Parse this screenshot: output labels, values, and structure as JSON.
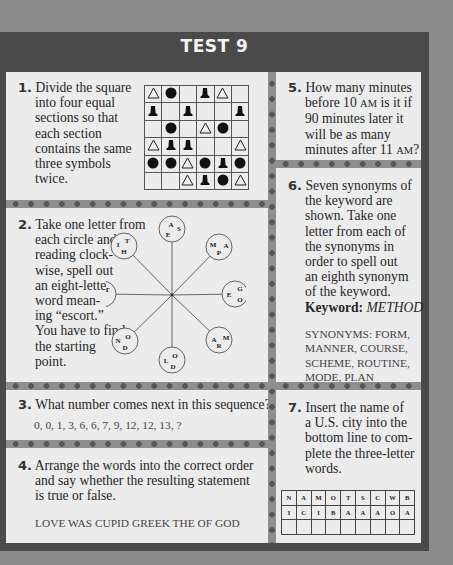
{
  "title": "TEST 9",
  "q1": {
    "number": "1.",
    "text_lines": [
      "Divide the square",
      "into four equal",
      "sections so that",
      "each section",
      "contains the same",
      "three symbols",
      "twice."
    ],
    "grid": [
      [
        "triangle",
        "circle",
        "",
        "bell",
        "triangle",
        ""
      ],
      [
        "bell",
        "",
        "bell",
        "",
        "",
        "bell"
      ],
      [
        "",
        "circle",
        "",
        "triangle",
        "circle",
        ""
      ],
      [
        "triangle",
        "bell",
        "bell",
        "",
        "",
        "triangle"
      ],
      [
        "circle",
        "circle",
        "triangle",
        "circle",
        "bell",
        "circle"
      ],
      [
        "",
        "",
        "triangle",
        "bell",
        "circle",
        "triangle"
      ]
    ]
  },
  "q2": {
    "number": "2.",
    "text_lines": [
      "Take one letter from",
      "each circle and,",
      "reading clock-",
      "wise, spell out",
      "an eight-letter",
      "word mean-",
      "ing “escort.”",
      "You have to find",
      "the starting",
      "point."
    ],
    "circles": [
      {
        "position": "top",
        "letters": [
          "A",
          "S",
          "E"
        ]
      },
      {
        "position": "top-right",
        "letters": [
          "M",
          "A",
          "P"
        ]
      },
      {
        "position": "right",
        "letters": [
          "G",
          "E",
          "O"
        ]
      },
      {
        "position": "bottom-right",
        "letters": [
          "A",
          "M",
          "R"
        ]
      },
      {
        "position": "bottom",
        "letters": [
          "L",
          "O",
          "D"
        ]
      },
      {
        "position": "bottom-left",
        "letters": [
          "N",
          "O",
          "D"
        ]
      },
      {
        "position": "left",
        "letters": [
          "C",
          "T",
          "A"
        ]
      },
      {
        "position": "top-left",
        "letters": [
          "I",
          "T",
          "H"
        ]
      }
    ]
  },
  "q3": {
    "number": "3.",
    "text": "What number comes next in this sequence?",
    "sequence": "0, 0, 1, 3, 6, 6, 7, 9, 12, 12, 13, ?"
  },
  "q4": {
    "number": "4.",
    "text_lines": [
      "Arrange the words into the correct order",
      "and say whether the resulting statement",
      "is true or false."
    ],
    "words": "LOVE WAS CUPID GREEK THE OF GOD"
  },
  "q5": {
    "number": "5.",
    "line1": "How many minutes",
    "line2_a": "before 10 ",
    "line2_sc": "AM",
    "line2_b": " is it if",
    "line3": "90 minutes later it",
    "line4": "will be as many",
    "line5_a": "minutes after 11 ",
    "line5_sc": "AM",
    "line5_b": "?"
  },
  "q6": {
    "number": "6.",
    "text_lines": [
      "Seven synonyms of",
      "the keyword are",
      "shown. Take one",
      "letter from each of",
      "the synonyms in",
      "order to spell out",
      "an eighth synonym",
      "of the keyword."
    ],
    "keyword_label": "Keyword:",
    "keyword": "METHOD",
    "synonyms_lines": [
      "SYNONYMS: FORM,",
      "MANNER, COURSE,",
      "SCHEME, ROUTINE,",
      "MODE, PLAN"
    ]
  },
  "q7": {
    "number": "7.",
    "text_lines": [
      "Insert the name of",
      "a U.S. city into the",
      "bottom line to com-",
      "plete the three-letter",
      "words."
    ],
    "row1": [
      "N",
      "A",
      "M",
      "O",
      "T",
      "S",
      "C",
      "W",
      "B"
    ],
    "row2": [
      "I",
      "C",
      "I",
      "B",
      "A",
      "A",
      "A",
      "O",
      "A"
    ],
    "row3": [
      "",
      "",
      "",
      "",
      "",
      "",
      "",
      "",
      ""
    ]
  }
}
